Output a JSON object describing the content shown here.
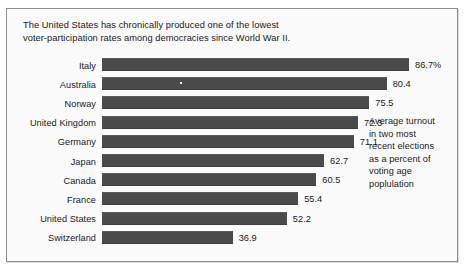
{
  "figure": {
    "title": "The United States has chronically produced one of the lowest\nvoter-participation rates among democracies since World War II.",
    "caption": "Average turnout\nin two most\nrecent elections\nas a percent of\nvoting age\npoplulation"
  },
  "chart_data": {
    "type": "bar",
    "orientation": "horizontal",
    "title": "The United States has chronically produced one of the lowest voter-participation rates among democracies since World War II.",
    "subtitle": "",
    "xlabel": "",
    "ylabel": "",
    "xlim": [
      0,
      86.7
    ],
    "grid": false,
    "legend": null,
    "annotations": [
      "Average turnout in two most recent elections as a percent of voting age poplulation"
    ],
    "categories": [
      "Italy",
      "Australia",
      "Norway",
      "United Kingdom",
      "Germany",
      "Japan",
      "Canada",
      "France",
      "United States",
      "Switzerland"
    ],
    "values": [
      86.7,
      80.4,
      75.5,
      72.3,
      71.1,
      62.7,
      60.5,
      55.4,
      52.2,
      36.9
    ],
    "value_labels": [
      "86.7%",
      "80.4",
      "75.5",
      "72.3",
      "71.1",
      "62.7",
      "60.5",
      "55.4",
      "52.2",
      "36.9"
    ],
    "bar_color": "#4b4b4b",
    "background_color": "#fbfbfb",
    "border_color": "#8d8d8d",
    "text_color": "#1a1a1a"
  }
}
